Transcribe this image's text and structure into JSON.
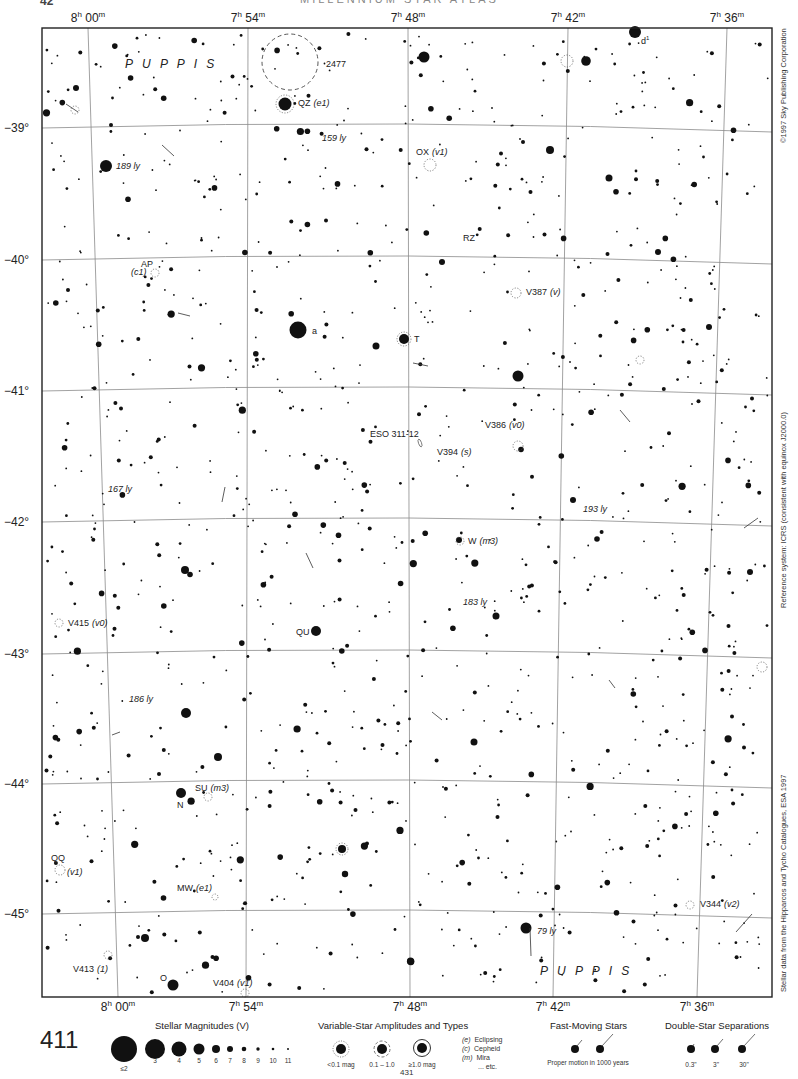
{
  "page": {
    "header_number": "42",
    "header_title": "MILLENNIUM STAR ATLAS",
    "page_number": "411",
    "next_page_ref": "431"
  },
  "colors": {
    "ink": "#111111",
    "grid": "#8a8a8a",
    "frame": "#222222",
    "paper": "#ffffff"
  },
  "axes": {
    "ra_top": [
      {
        "h": "8",
        "m": "00",
        "x": 88
      },
      {
        "h": "7",
        "m": "54",
        "x": 248
      },
      {
        "h": "7",
        "m": "48",
        "x": 408
      },
      {
        "h": "7",
        "m": "42",
        "x": 568
      },
      {
        "h": "7",
        "m": "36",
        "x": 727
      }
    ],
    "ra_bottom": [
      {
        "h": "8",
        "m": "00",
        "x": 118
      },
      {
        "h": "7",
        "m": "54",
        "x": 246
      },
      {
        "h": "7",
        "m": "48",
        "x": 410
      },
      {
        "h": "7",
        "m": "42",
        "x": 553
      },
      {
        "h": "7",
        "m": "36",
        "x": 697
      }
    ],
    "dec": [
      {
        "label": "−39°",
        "y": 128
      },
      {
        "label": "−40°",
        "y": 260
      },
      {
        "label": "−41°",
        "y": 391
      },
      {
        "label": "−42°",
        "y": 522
      },
      {
        "label": "−43°",
        "y": 654
      },
      {
        "label": "−44°",
        "y": 784
      },
      {
        "label": "−45°",
        "y": 914
      }
    ]
  },
  "side_notes": {
    "copyright": "©1997 Sky Publishing Corporation",
    "reference": "Reference system: ICRS (consistent with equinox J2000.0)",
    "source": "Stellar data from the Hipparcos and Tycho Catalogues, ESA 1997"
  },
  "constellations": [
    {
      "name": "P U P P I S",
      "x": 125,
      "y": 68
    },
    {
      "name": "P U P P I S",
      "x": 540,
      "y": 975
    }
  ],
  "labels": [
    {
      "text": "2477",
      "x": 326,
      "y": 67,
      "italic": false
    },
    {
      "text": "QZ",
      "x": 298,
      "y": 106,
      "italic": false,
      "suffix": "(e1)"
    },
    {
      "text": "d",
      "x": 641,
      "y": 44,
      "italic": false,
      "sup": "1"
    },
    {
      "text": "159 ly",
      "x": 322,
      "y": 141,
      "italic": true
    },
    {
      "text": "189 ly",
      "x": 116,
      "y": 169,
      "italic": true
    },
    {
      "text": "OX",
      "x": 416,
      "y": 155,
      "italic": false,
      "suffix": "(v1)"
    },
    {
      "text": "RZ",
      "x": 463,
      "y": 241,
      "italic": false
    },
    {
      "text": "AP",
      "x": 141,
      "y": 267,
      "italic": false
    },
    {
      "text": "(c1)",
      "x": 131,
      "y": 275,
      "italic": true
    },
    {
      "text": "V387",
      "x": 526,
      "y": 295,
      "italic": false,
      "suffix": "(v)"
    },
    {
      "text": "a",
      "x": 312,
      "y": 334,
      "italic": false
    },
    {
      "text": "T",
      "x": 414,
      "y": 342,
      "italic": false
    },
    {
      "text": "V386",
      "x": 485,
      "y": 428,
      "italic": false,
      "suffix": "(v0)"
    },
    {
      "text": "ESO 311-12",
      "x": 370,
      "y": 437,
      "italic": false
    },
    {
      "text": "V394",
      "x": 437,
      "y": 455,
      "italic": false,
      "suffix": "(s)"
    },
    {
      "text": "167 ly",
      "x": 108,
      "y": 492,
      "italic": true
    },
    {
      "text": "193 ly",
      "x": 583,
      "y": 512,
      "italic": true
    },
    {
      "text": "W",
      "x": 468,
      "y": 544,
      "italic": false,
      "suffix": "(m3)"
    },
    {
      "text": "183 ly",
      "x": 463,
      "y": 605,
      "italic": true
    },
    {
      "text": "V415",
      "x": 68,
      "y": 626,
      "italic": false,
      "suffix": "(v0)"
    },
    {
      "text": "QU",
      "x": 296,
      "y": 635,
      "italic": false
    },
    {
      "text": "186 ly",
      "x": 129,
      "y": 702,
      "italic": true
    },
    {
      "text": "SU",
      "x": 195,
      "y": 791,
      "italic": false,
      "suffix": "(m3)"
    },
    {
      "text": "N",
      "x": 177,
      "y": 808,
      "italic": false
    },
    {
      "text": "QQ",
      "x": 51,
      "y": 861,
      "italic": false
    },
    {
      "text": "(v1)",
      "x": 67,
      "y": 875,
      "italic": true
    },
    {
      "text": "MW",
      "x": 177,
      "y": 891,
      "italic": false,
      "suffix": "(e1)"
    },
    {
      "text": "V344",
      "x": 700,
      "y": 907,
      "italic": false,
      "suffix": "(v2)"
    },
    {
      "text": "79 ly",
      "x": 537,
      "y": 934,
      "italic": true
    },
    {
      "text": "V413",
      "x": 73,
      "y": 972,
      "italic": false,
      "suffix": "(1)"
    },
    {
      "text": "O",
      "x": 160,
      "y": 981,
      "italic": false
    },
    {
      "text": "V404",
      "x": 213,
      "y": 986,
      "italic": false,
      "suffix": "(v1)"
    }
  ],
  "legend": {
    "magnitudes": {
      "title": "Stellar Magnitudes (V)",
      "items": [
        "≤2",
        "3",
        "4",
        "5",
        "6",
        "7",
        "8",
        "9",
        "10",
        "11"
      ]
    },
    "variables": {
      "title": "Variable-Star Amplitudes and Types",
      "amplitudes": [
        "<0.1 mag",
        "0.1 – 1.0",
        "≥1.0 mag"
      ],
      "types": [
        {
          "code": "(e)",
          "name": "Eclipsing"
        },
        {
          "code": "(c)",
          "name": "Cepheid"
        },
        {
          "code": "(m)",
          "name": "Mira"
        },
        {
          "code": "",
          "name": "... etc."
        }
      ]
    },
    "fast_moving": {
      "title": "Fast-Moving Stars",
      "caption": "Proper motion in 1000 years"
    },
    "doubles": {
      "title": "Double-Star Separations",
      "items": [
        "0.3\"",
        "3\"",
        "30\""
      ]
    }
  }
}
